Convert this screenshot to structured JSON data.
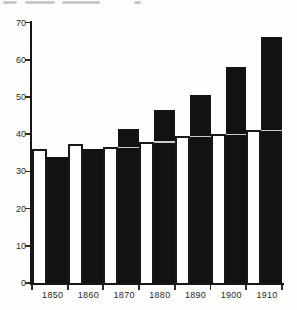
{
  "chart_data": {
    "type": "bar",
    "title": "",
    "categories": [
      "1850",
      "1860",
      "1870",
      "1880",
      "1890",
      "1900",
      "1910"
    ],
    "series": [
      {
        "name": "outlined-white-bars",
        "style": "white fill, black outline, top rule continues across adjacent black bar",
        "values": [
          36,
          37.5,
          36.5,
          38,
          39.5,
          40,
          41
        ]
      },
      {
        "name": "solid-black-bars",
        "style": "solid black",
        "values": [
          34,
          36,
          41.5,
          46.5,
          50.5,
          58,
          66
        ]
      }
    ],
    "xlabel": "",
    "ylabel": "",
    "ylim": [
      0,
      70
    ],
    "yticks": [
      0,
      10,
      20,
      30,
      40,
      50,
      60,
      70
    ],
    "ytick_labels": [
      "0",
      "10",
      "20",
      "30",
      "40",
      "50",
      "60",
      "70"
    ],
    "grid": false,
    "legend_position": "none"
  },
  "colors": {
    "bar_black": "#121212",
    "bar_white": "#ffffff",
    "axis": "#161616",
    "background": "#fdfdfc",
    "label_text": "#2b2b2b"
  }
}
